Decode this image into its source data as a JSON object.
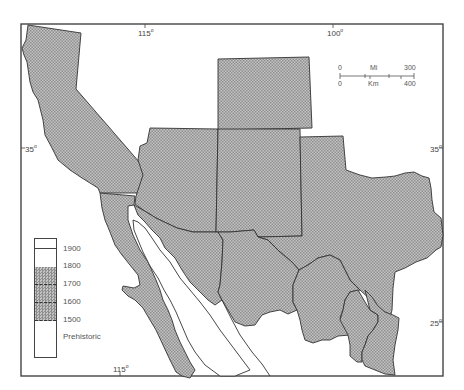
{
  "map": {
    "title": "",
    "colors": {
      "region_fill": "#b8b8b8",
      "border": "#333333",
      "frame": "#444444",
      "background": "#ffffff"
    },
    "graticule": {
      "top_labels": [
        {
          "text": "115",
          "unit": "o",
          "x": 143
        },
        {
          "text": "100",
          "unit": "o",
          "x": 335
        }
      ],
      "bottom_labels": [
        {
          "text": "115",
          "unit": "o",
          "x": 118
        }
      ],
      "left_labels": [
        {
          "text": "35",
          "unit": "o",
          "y": 148
        }
      ],
      "right_labels": [
        {
          "text": "35",
          "unit": "o",
          "y": 148
        },
        {
          "text": "25",
          "unit": "o",
          "y": 322
        }
      ]
    },
    "scale_bar": {
      "miles_start": "0",
      "miles_unit": "Mi",
      "miles_end": "300",
      "km_start": "0",
      "km_unit": "Km",
      "km_end": "400"
    },
    "legend": {
      "entries": [
        {
          "label": "1900",
          "fill": "white"
        },
        {
          "label": "1800",
          "fill": "white"
        },
        {
          "label": "1700",
          "fill": "stipple"
        },
        {
          "label": "1600",
          "fill": "stipple"
        },
        {
          "label": "1500",
          "fill": "stipple"
        },
        {
          "label": "Prehistoric",
          "fill": "white"
        }
      ]
    },
    "regions": [
      "California",
      "Arizona",
      "New Mexico",
      "Colorado",
      "Texas",
      "Baja California",
      "Sonora",
      "Chihuahua",
      "Coahuila",
      "Nuevo Leon",
      "Tamaulipas",
      "Durango",
      "San Luis Potosi"
    ]
  }
}
